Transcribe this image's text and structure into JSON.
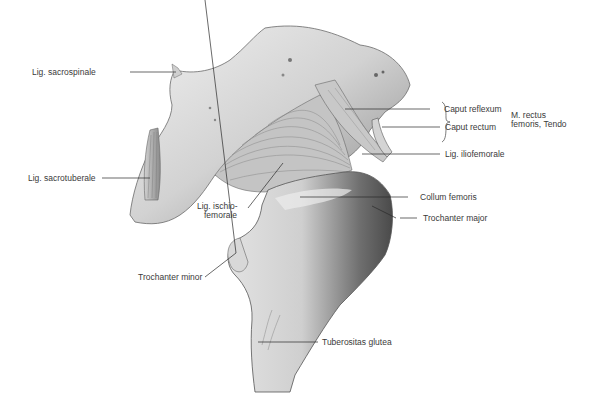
{
  "figure": {
    "labels": {
      "lig_sacrospinale": "Lig. sacrospinale",
      "lig_sacrotuberale": "Lig. sacrotuberale",
      "caput_reflexum": "Caput reflexum",
      "caput_rectum": "Caput rectum",
      "m_rectus_line1": "M. rectus",
      "m_rectus_line2": "femoris, Tendo",
      "lig_iliofemorale": "Lig. iliofemorale",
      "lig_ischiofemorale_line1": "Lig. ischio-",
      "lig_ischiofemorale_line2": "femorale",
      "collum_femoris": "Collum femoris",
      "trochanter_major": "Trochanter major",
      "trochanter_minor": "Trochanter minor",
      "tuberositas_glutea": "Tuberositas glutea"
    },
    "colors": {
      "bone_light": "#e6e6e6",
      "bone_mid": "#bdbdbd",
      "bone_dark": "#7a7a7a",
      "leader_line": "#2a2a2a",
      "label_text": "#3a3a3a"
    }
  }
}
